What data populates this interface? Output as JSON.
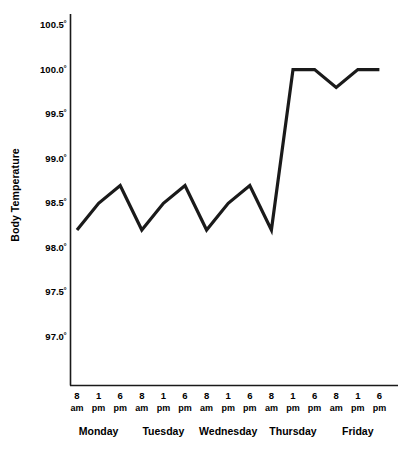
{
  "chart_data": {
    "type": "line",
    "title": "",
    "xlabel": "",
    "ylabel": "Body Temperature",
    "ylim": [
      96.75,
      100.75
    ],
    "grid": false,
    "legend": null,
    "y_ticks": [
      "100.5˚",
      "100.0˚",
      "99.5˚",
      "99.0˚",
      "98.5˚",
      "98.0˚",
      "97.5˚",
      "97.0˚"
    ],
    "y_tick_values": [
      100.5,
      100.0,
      99.5,
      99.0,
      98.5,
      98.0,
      97.5,
      97.0
    ],
    "days": [
      "Monday",
      "Tuesday",
      "Wednesday",
      "Thursday",
      "Friday"
    ],
    "times": [
      "8 am",
      "1 pm",
      "6 pm"
    ],
    "x_ticks": [
      {
        "hour": "8",
        "ampm": "am"
      },
      {
        "hour": "1",
        "ampm": "pm"
      },
      {
        "hour": "6",
        "ampm": "pm"
      },
      {
        "hour": "8",
        "ampm": "am"
      },
      {
        "hour": "1",
        "ampm": "pm"
      },
      {
        "hour": "6",
        "ampm": "pm"
      },
      {
        "hour": "8",
        "ampm": "am"
      },
      {
        "hour": "1",
        "ampm": "pm"
      },
      {
        "hour": "6",
        "ampm": "pm"
      },
      {
        "hour": "8",
        "ampm": "am"
      },
      {
        "hour": "1",
        "ampm": "pm"
      },
      {
        "hour": "6",
        "ampm": "pm"
      },
      {
        "hour": "8",
        "ampm": "am"
      },
      {
        "hour": "1",
        "ampm": "pm"
      },
      {
        "hour": "6",
        "ampm": "pm"
      }
    ],
    "categories": [
      "Monday 8 am",
      "Monday 1 pm",
      "Monday 6 pm",
      "Tuesday 8 am",
      "Tuesday 1 pm",
      "Tuesday 6 pm",
      "Wednesday 8 am",
      "Wednesday 1 pm",
      "Wednesday 6 pm",
      "Thursday 8 am",
      "Thursday 1 pm",
      "Thursday 6 pm",
      "Friday 8 am",
      "Friday 1 pm",
      "Friday 6 pm"
    ],
    "values": [
      98.2,
      98.5,
      98.7,
      98.2,
      98.5,
      98.7,
      98.2,
      98.5,
      98.7,
      98.2,
      100.0,
      100.0,
      99.8,
      100.0,
      100.0
    ],
    "line_color": "#1a1a1a",
    "axis_color": "#1a1a1a"
  }
}
